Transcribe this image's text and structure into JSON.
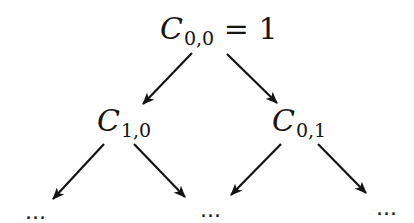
{
  "diagram": {
    "type": "binary-tree",
    "colors": {
      "stroke": "#141414",
      "background": "#ffffff"
    },
    "root": {
      "var": "C",
      "sub": "0,0",
      "rest": " = 1",
      "label": "C_{0,0} = 1"
    },
    "level1": [
      {
        "var": "C",
        "sub": "1,0",
        "label": "C_{1,0}"
      },
      {
        "var": "C",
        "sub": "0,1",
        "label": "C_{0,1}"
      }
    ],
    "level2": [
      {
        "label": "..."
      },
      {
        "label": "..."
      },
      {
        "label": "..."
      }
    ],
    "edges": [
      {
        "from": "C_{0,0}",
        "to": "C_{1,0}"
      },
      {
        "from": "C_{0,0}",
        "to": "C_{0,1}"
      },
      {
        "from": "C_{1,0}",
        "to": "... (left)"
      },
      {
        "from": "C_{1,0}",
        "to": "... (middle)"
      },
      {
        "from": "C_{0,1}",
        "to": "... (middle)"
      },
      {
        "from": "C_{0,1}",
        "to": "... (right)"
      }
    ]
  }
}
